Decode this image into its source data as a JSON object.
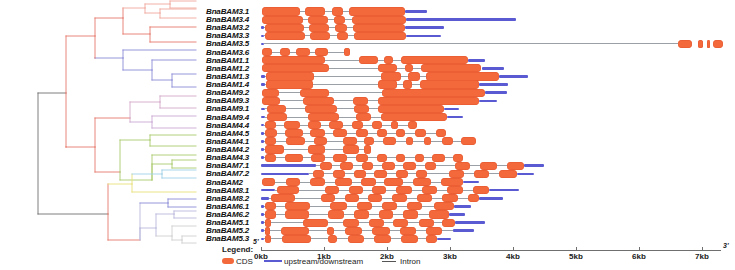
{
  "figure": {
    "type": "gene-structure-with-phylogenetic-tree",
    "organism_prefix": "BnaBAM"
  },
  "axis": {
    "ticks": [
      "0kb",
      "1kb",
      "2kb",
      "3kb",
      "4kb",
      "5kb",
      "6kb",
      "7kb"
    ],
    "tick_values": [
      0,
      1,
      2,
      3,
      4,
      5,
      6,
      7
    ],
    "unit": "kb",
    "start_label": "5'",
    "end_label": "3'",
    "range": [
      0,
      7.3
    ]
  },
  "legend": {
    "title": "Legend:",
    "items": [
      {
        "label": "CDS",
        "color": "#f4693c",
        "shape": "box"
      },
      {
        "label": "upstream/downstream",
        "color": "#5a5ad2",
        "shape": "line"
      },
      {
        "label": "Intron",
        "color": "#555555",
        "shape": "line"
      }
    ]
  },
  "colors": {
    "cds": "#f4693c",
    "utr": "#5a5ad2",
    "intron": "#9aa0a6",
    "tree_red": "#e8796b",
    "tree_blue": "#8a8ad8",
    "tree_green": "#aacb6e",
    "tree_cyan": "#9fd0e8",
    "tree_gray": "#6f6f6f"
  },
  "genes": [
    {
      "label": "BnaBAM3.1",
      "clade_color": "#f0a79c",
      "utr": [
        [
          2.28,
          2.64
        ]
      ],
      "cds": [
        [
          0.02,
          0.62
        ],
        [
          0.7,
          1.02
        ],
        [
          1.12,
          1.3
        ],
        [
          1.4,
          2.28
        ]
      ],
      "intron": [
        0.02,
        2.28
      ]
    },
    {
      "label": "BnaBAM3.4",
      "clade_color": "#f0a79c",
      "utr": [
        [
          2.3,
          4.05
        ]
      ],
      "cds": [
        [
          0.02,
          0.66
        ],
        [
          0.74,
          1.06
        ],
        [
          1.16,
          1.34
        ],
        [
          1.44,
          2.3
        ]
      ],
      "intron": [
        0.02,
        2.3
      ]
    },
    {
      "label": "BnaBAM3.2",
      "clade_color": "#f0a79c",
      "utr": [
        [
          0.0,
          0.05
        ],
        [
          2.28,
          2.9
        ]
      ],
      "cds": [
        [
          0.07,
          0.68
        ],
        [
          0.76,
          1.08
        ],
        [
          1.18,
          1.36
        ],
        [
          1.46,
          2.28
        ]
      ],
      "intron": [
        0.05,
        2.28
      ]
    },
    {
      "label": "BnaBAM3.3",
      "clade_color": "#f0a79c",
      "utr": [
        [
          0.0,
          0.05
        ],
        [
          2.3,
          2.86
        ]
      ],
      "cds": [
        [
          0.07,
          0.7
        ],
        [
          0.78,
          1.1
        ],
        [
          1.2,
          1.38
        ],
        [
          1.48,
          2.3
        ]
      ],
      "intron": [
        0.05,
        2.3
      ]
    },
    {
      "label": "BnaBAM3.5",
      "clade_color": "#e8796b",
      "utr": [
        [
          0.0,
          0.04
        ]
      ],
      "cds": [
        [
          6.62,
          6.84
        ],
        [
          6.94,
          7.02
        ],
        [
          7.08,
          7.12
        ],
        [
          7.18,
          7.34
        ]
      ],
      "intron": [
        0.04,
        6.62
      ]
    },
    {
      "label": "BnaBAM3.6",
      "clade_color": "#e8796b",
      "utr": [],
      "cds": [
        [
          0.02,
          0.18
        ],
        [
          0.3,
          0.46
        ],
        [
          0.56,
          0.78
        ],
        [
          0.86,
          1.06
        ],
        [
          1.32,
          1.42
        ]
      ],
      "intron": [
        0.02,
        1.42
      ]
    },
    {
      "label": "BnaBAM1.1",
      "clade_color": "#8a8ad8",
      "utr": [
        [
          3.28,
          3.56
        ]
      ],
      "cds": [
        [
          0.02,
          1.02
        ],
        [
          1.56,
          1.86
        ],
        [
          1.96,
          2.1
        ],
        [
          2.22,
          3.28
        ]
      ],
      "intron": [
        0.02,
        3.28
      ]
    },
    {
      "label": "BnaBAM1.2",
      "clade_color": "#8a8ad8",
      "utr": [
        [
          3.5,
          3.86
        ]
      ],
      "cds": [
        [
          0.02,
          1.08
        ],
        [
          1.86,
          2.16
        ],
        [
          2.28,
          2.42
        ],
        [
          2.54,
          3.5
        ]
      ],
      "intron": [
        0.02,
        3.5
      ]
    },
    {
      "label": "BnaBAM1.3",
      "clade_color": "#8a8ad8",
      "utr": [
        [
          0.0,
          0.06
        ],
        [
          3.78,
          4.24
        ]
      ],
      "cds": [
        [
          0.08,
          0.84
        ],
        [
          1.9,
          2.22
        ],
        [
          2.34,
          2.52
        ],
        [
          2.62,
          3.78
        ]
      ],
      "intron": [
        0.06,
        3.78
      ]
    },
    {
      "label": "BnaBAM1.4",
      "clade_color": "#8a8ad8",
      "utr": [
        [
          0.0,
          0.06
        ],
        [
          3.46,
          3.92
        ]
      ],
      "cds": [
        [
          0.08,
          0.82
        ],
        [
          1.86,
          2.16
        ],
        [
          2.26,
          2.4
        ],
        [
          2.52,
          3.46
        ]
      ],
      "intron": [
        0.06,
        3.46
      ]
    },
    {
      "label": "BnaBAM9.2",
      "clade_color": "#d4a8c8",
      "utr": [
        [
          3.56,
          3.9
        ]
      ],
      "cds": [
        [
          0.02,
          0.28
        ],
        [
          0.62,
          1.08
        ],
        [
          1.92,
          3.56
        ]
      ],
      "intron": [
        0.02,
        3.56
      ]
    },
    {
      "label": "BnaBAM9.3",
      "clade_color": "#d4a8c8",
      "utr": [
        [
          3.46,
          3.74
        ]
      ],
      "cds": [
        [
          0.02,
          0.3
        ],
        [
          0.66,
          1.16
        ],
        [
          1.46,
          1.7
        ],
        [
          1.86,
          3.46
        ]
      ],
      "intron": [
        0.02,
        3.46
      ]
    },
    {
      "label": "BnaBAM9.1",
      "clade_color": "#c9a8d4",
      "utr": [
        [
          0.0,
          0.06
        ],
        [
          2.9,
          3.14
        ]
      ],
      "cds": [
        [
          0.1,
          0.4
        ],
        [
          0.7,
          1.2
        ],
        [
          1.48,
          1.72
        ],
        [
          1.86,
          2.9
        ]
      ],
      "intron": [
        0.06,
        2.9
      ]
    },
    {
      "label": "BnaBAM9.4",
      "clade_color": "#c9a8d4",
      "utr": [
        [
          0.0,
          0.06
        ],
        [
          2.96,
          3.2
        ]
      ],
      "cds": [
        [
          0.1,
          0.42
        ],
        [
          0.74,
          1.24
        ],
        [
          1.5,
          1.74
        ],
        [
          1.9,
          2.96
        ]
      ],
      "intron": [
        0.06,
        2.96
      ]
    },
    {
      "label": "BnaBAM4.4",
      "clade_color": "#aacb6e",
      "utr": [
        [
          0.0,
          0.04
        ]
      ],
      "cds": [
        [
          0.06,
          0.24
        ],
        [
          0.36,
          0.62
        ],
        [
          0.74,
          0.96
        ],
        [
          1.08,
          1.3
        ],
        [
          1.44,
          1.62
        ],
        [
          1.76,
          1.92
        ],
        [
          2.06,
          2.18
        ],
        [
          2.34,
          2.48
        ]
      ],
      "intron": [
        0.04,
        2.48
      ]
    },
    {
      "label": "BnaBAM4.5",
      "clade_color": "#aacb6e",
      "utr": [
        [
          0.0,
          0.04
        ]
      ],
      "cds": [
        [
          0.06,
          0.26
        ],
        [
          0.38,
          0.66
        ],
        [
          0.78,
          1.02
        ],
        [
          1.14,
          1.36
        ],
        [
          1.5,
          1.7
        ],
        [
          1.84,
          2.0
        ],
        [
          2.14,
          2.28
        ],
        [
          2.44,
          2.62
        ],
        [
          2.78,
          2.94
        ]
      ],
      "intron": [
        0.04,
        2.94
      ]
    },
    {
      "label": "BnaBAM4.1",
      "clade_color": "#aacb6e",
      "utr": [
        [
          0.0,
          0.04
        ]
      ],
      "cds": [
        [
          0.06,
          0.24
        ],
        [
          0.4,
          0.7
        ],
        [
          0.84,
          1.04
        ],
        [
          1.3,
          1.52
        ],
        [
          1.64,
          1.8
        ],
        [
          1.94,
          2.14
        ],
        [
          2.3,
          2.42
        ],
        [
          2.58,
          2.7
        ],
        [
          2.88,
          3.04
        ],
        [
          3.18,
          3.42
        ]
      ],
      "intron": [
        0.04,
        3.42
      ]
    },
    {
      "label": "BnaBAM4.2",
      "clade_color": "#aacb6e",
      "utr": [
        [
          0.0,
          0.04
        ]
      ],
      "cds": [
        [
          0.06,
          0.36
        ],
        [
          0.74,
          1.02
        ],
        [
          1.3,
          1.56
        ],
        [
          1.64,
          1.74
        ]
      ],
      "intron": [
        0.04,
        1.74
      ]
    },
    {
      "label": "BnaBAM4.3",
      "clade_color": "#aacb6e",
      "utr": [
        [
          0.0,
          0.04
        ]
      ],
      "cds": [
        [
          0.06,
          0.24
        ],
        [
          0.38,
          0.66
        ],
        [
          0.8,
          1.02
        ],
        [
          1.14,
          1.36
        ],
        [
          1.5,
          1.7
        ],
        [
          1.84,
          2.0
        ],
        [
          2.14,
          2.28
        ],
        [
          2.44,
          2.58
        ],
        [
          2.72,
          2.92
        ],
        [
          3.04,
          3.2
        ]
      ],
      "intron": [
        0.04,
        3.2
      ]
    },
    {
      "label": "BnaBAM7.1",
      "clade_color": "#9fd0e8",
      "utr": [
        [
          0.0,
          0.88
        ],
        [
          4.18,
          4.5
        ]
      ],
      "cds": [
        [
          0.94,
          1.12
        ],
        [
          1.26,
          1.46
        ],
        [
          1.6,
          1.78
        ],
        [
          1.92,
          2.12
        ],
        [
          2.26,
          2.46
        ],
        [
          2.6,
          2.78
        ],
        [
          3.08,
          3.32
        ],
        [
          3.48,
          3.74
        ],
        [
          3.9,
          4.18
        ]
      ],
      "intron": [
        0.88,
        4.18
      ]
    },
    {
      "label": "BnaBAM7.2",
      "clade_color": "#9fd0e8",
      "utr": [
        [
          0.0,
          0.76
        ],
        [
          4.06,
          4.34
        ]
      ],
      "cds": [
        [
          0.82,
          1.0
        ],
        [
          1.14,
          1.34
        ],
        [
          1.48,
          1.66
        ],
        [
          1.8,
          2.0
        ],
        [
          2.14,
          2.34
        ],
        [
          2.46,
          2.64
        ],
        [
          2.98,
          3.22
        ],
        [
          3.38,
          3.62
        ],
        [
          3.78,
          4.06
        ]
      ],
      "intron": [
        0.76,
        4.06
      ]
    },
    {
      "label": "BnaBAM2",
      "clade_color": "#e8e07a",
      "utr": [
        [
          3.2,
          3.46
        ]
      ],
      "cds": [
        [
          0.02,
          0.22
        ],
        [
          0.4,
          0.62
        ],
        [
          0.78,
          1.02
        ],
        [
          1.18,
          1.44
        ],
        [
          1.58,
          1.82
        ],
        [
          1.96,
          2.26
        ],
        [
          2.42,
          2.7
        ],
        [
          2.86,
          3.2
        ]
      ],
      "intron": [
        0.02,
        3.2
      ]
    },
    {
      "label": "BnaBAM8.1",
      "clade_color": "#8a8ad8",
      "utr": [
        [
          0.0,
          0.22
        ],
        [
          3.62,
          4.1
        ]
      ],
      "cds": [
        [
          0.26,
          0.6
        ],
        [
          1.02,
          1.24
        ],
        [
          1.4,
          1.62
        ],
        [
          1.76,
          1.98
        ],
        [
          2.14,
          2.4
        ],
        [
          2.56,
          2.8
        ],
        [
          2.96,
          3.2
        ],
        [
          3.36,
          3.62
        ]
      ],
      "intron": [
        0.22,
        3.62
      ]
    },
    {
      "label": "BnaBAM8.2",
      "clade_color": "#8a8ad8",
      "utr": [
        [
          0.0,
          0.12
        ],
        [
          3.46,
          3.84
        ]
      ],
      "cds": [
        [
          0.16,
          0.54
        ],
        [
          0.96,
          1.18
        ],
        [
          1.34,
          1.56
        ],
        [
          1.7,
          1.92
        ],
        [
          2.08,
          2.32
        ],
        [
          2.48,
          2.72
        ],
        [
          2.88,
          3.12
        ],
        [
          3.28,
          3.46
        ]
      ],
      "intron": [
        0.12,
        3.46
      ]
    },
    {
      "label": "BnaBAM6.1",
      "clade_color": "#b8b8dc",
      "utr": [
        [
          0.0,
          0.04
        ],
        [
          3.06,
          3.34
        ]
      ],
      "cds": [
        [
          0.06,
          0.24
        ],
        [
          0.38,
          0.78
        ],
        [
          1.1,
          1.36
        ],
        [
          1.52,
          1.76
        ],
        [
          1.92,
          2.16
        ],
        [
          2.32,
          2.56
        ],
        [
          2.74,
          3.06
        ]
      ],
      "intron": [
        0.04,
        3.06
      ]
    },
    {
      "label": "BnaBAM6.2",
      "clade_color": "#b8b8dc",
      "utr": [
        [
          0.0,
          0.04
        ],
        [
          2.98,
          3.24
        ]
      ],
      "cds": [
        [
          0.06,
          0.24
        ],
        [
          0.38,
          0.76
        ],
        [
          1.06,
          1.32
        ],
        [
          1.48,
          1.72
        ],
        [
          1.88,
          2.1
        ],
        [
          2.26,
          2.5
        ],
        [
          2.66,
          2.98
        ]
      ],
      "intron": [
        0.04,
        2.98
      ]
    },
    {
      "label": "BnaBAM5.1",
      "clade_color": "#cfcfcf",
      "utr": [
        [
          0.0,
          0.04
        ],
        [
          3.08,
          3.56
        ]
      ],
      "cds": [
        [
          0.06,
          0.16
        ],
        [
          0.66,
          1.06
        ],
        [
          1.3,
          1.56
        ],
        [
          1.72,
          1.96
        ],
        [
          2.1,
          2.34
        ],
        [
          2.5,
          2.74
        ],
        [
          2.88,
          3.08
        ]
      ],
      "intron": [
        0.04,
        3.08
      ]
    },
    {
      "label": "BnaBAM5.2",
      "clade_color": "#cfcfcf",
      "utr": [
        [
          0.0,
          0.04
        ],
        [
          3.04,
          3.38
        ]
      ],
      "cds": [
        [
          0.06,
          0.14
        ],
        [
          0.32,
          0.76
        ],
        [
          1.04,
          1.16
        ],
        [
          1.34,
          1.6
        ],
        [
          1.76,
          2.04
        ],
        [
          2.2,
          2.46
        ],
        [
          2.62,
          2.88
        ]
      ],
      "intron": [
        0.04,
        3.04
      ]
    },
    {
      "label": "BnaBAM5.3",
      "clade_color": "#cfcfcf",
      "utr": [
        [
          0.0,
          0.04
        ],
        [
          2.8,
          3.02
        ]
      ],
      "cds": [
        [
          0.06,
          0.16
        ],
        [
          0.34,
          0.8
        ],
        [
          1.06,
          1.2
        ],
        [
          1.38,
          1.64
        ],
        [
          1.8,
          2.06
        ],
        [
          2.22,
          2.5
        ],
        [
          2.62,
          2.8
        ]
      ],
      "intron": [
        0.04,
        2.8
      ]
    }
  ]
}
